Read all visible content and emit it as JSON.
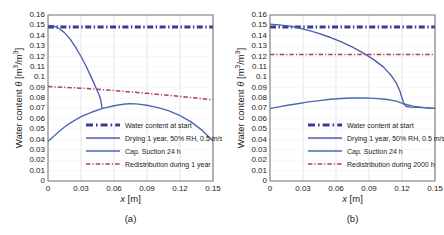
{
  "figure": {
    "width": 444,
    "height": 235,
    "background": "#ffffff"
  },
  "colors": {
    "start_line": "#3b3b8f",
    "drying_line": "#4a5fa5",
    "suction_line": "#4a6ab0",
    "redistribution_line": "#b23a6b",
    "axis": "#6f6f6f",
    "grid": "#d9d9e3",
    "text": "#1a1a1a"
  },
  "panels": [
    {
      "id": "a",
      "caption": "(a)",
      "xlabel_italic": "x",
      "xlabel_unit": "[m]",
      "ylabel_prefix": "Water content ",
      "ylabel_symbol": "θ",
      "ylabel_unit": "[m³/m³]",
      "xticks": [
        "0",
        "0.03",
        "0.06",
        "0.09",
        "0.12",
        "0.15"
      ],
      "xtick_values": [
        0,
        0.03,
        0.06,
        0.09,
        0.12,
        0.15
      ],
      "yticks": [
        "0",
        "0.01",
        "0.02",
        "0.03",
        "0.04",
        "0.05",
        "0.06",
        "0.07",
        "0.08",
        "0.09",
        "0.1",
        "0.11",
        "0.12",
        "0.13",
        "0.14",
        "0.15",
        "0.16"
      ],
      "ytick_values": [
        0,
        0.01,
        0.02,
        0.03,
        0.04,
        0.05,
        0.06,
        0.07,
        0.08,
        0.09,
        0.1,
        0.11,
        0.12,
        0.13,
        0.14,
        0.15,
        0.16
      ],
      "legend": [
        {
          "label": "Water content at start",
          "style": "dashdot-thick",
          "color": "#3b3b8f"
        },
        {
          "label": "Drying 1 year, 50% RH, 0.5 m/s",
          "style": "solid",
          "color": "#4a5fa5"
        },
        {
          "label": "Cap. Suction 24 h",
          "style": "solid",
          "color": "#4a6ab0"
        },
        {
          "label": "Redistribution during 1 year",
          "style": "dashdot-thin",
          "color": "#b23a6b"
        }
      ]
    },
    {
      "id": "b",
      "caption": "(b)",
      "xlabel_italic": "x",
      "xlabel_unit": "[m]",
      "ylabel_prefix": "Water content ",
      "ylabel_symbol": "θ",
      "ylabel_unit": "[m³/m³]",
      "xticks": [
        "0",
        "0.03",
        "0.06",
        "0.09",
        "0.12",
        "0.15"
      ],
      "xtick_values": [
        0,
        0.03,
        0.06,
        0.09,
        0.12,
        0.15
      ],
      "yticks": [
        "0",
        "0.01",
        "0.02",
        "0.03",
        "0.04",
        "0.05",
        "0.06",
        "0.07",
        "0.08",
        "0.09",
        "0.1",
        "0.11",
        "0.12",
        "0.13",
        "0.14",
        "0.15",
        "0.16"
      ],
      "ytick_values": [
        0,
        0.01,
        0.02,
        0.03,
        0.04,
        0.05,
        0.06,
        0.07,
        0.08,
        0.09,
        0.1,
        0.11,
        0.12,
        0.13,
        0.14,
        0.15,
        0.16
      ],
      "legend": [
        {
          "label": "Water content at start",
          "style": "dashdot-thick",
          "color": "#3b3b8f"
        },
        {
          "label": "Drying 1 year, 50% RH, 0.5 m/s",
          "style": "solid",
          "color": "#4a5fa5"
        },
        {
          "label": "Cap. Suction 24 h",
          "style": "solid",
          "color": "#4a6ab0"
        },
        {
          "label": "Redistribution during 2000 h",
          "style": "dashdot-thin",
          "color": "#b23a6b"
        }
      ]
    }
  ],
  "chart_data": [
    {
      "type": "line",
      "panel": "a",
      "title": "(a)",
      "xlabel": "x [m]",
      "ylabel": "Water content θ [m³/m³]",
      "xlim": [
        0,
        0.15
      ],
      "ylim": [
        0,
        0.16
      ],
      "xticks": [
        0,
        0.03,
        0.06,
        0.09,
        0.12,
        0.15
      ],
      "yticks": [
        0,
        0.01,
        0.02,
        0.03,
        0.04,
        0.05,
        0.06,
        0.07,
        0.08,
        0.09,
        0.1,
        0.11,
        0.12,
        0.13,
        0.14,
        0.15,
        0.16
      ],
      "grid": true,
      "legend_position": "lower center",
      "series": [
        {
          "name": "Water content at start",
          "style": "dashdot-thick",
          "color": "#3b3b8f",
          "x": [
            0,
            0.15
          ],
          "y": [
            0.1485,
            0.1485
          ]
        },
        {
          "name": "Drying 1 year, 50% RH, 0.5 m/s",
          "style": "solid",
          "color": "#4a5fa5",
          "x": [
            0,
            0.005,
            0.01,
            0.015,
            0.02,
            0.025,
            0.03,
            0.034,
            0.038,
            0.041,
            0.044,
            0.046,
            0.0475,
            0.0485,
            0.049,
            0.05
          ],
          "y": [
            0.15,
            0.1495,
            0.147,
            0.143,
            0.137,
            0.129,
            0.12,
            0.112,
            0.103,
            0.096,
            0.089,
            0.084,
            0.08,
            0.0745,
            0.071,
            0.07
          ]
        },
        {
          "name": "Cap. Suction 24 h",
          "style": "solid",
          "color": "#4a6ab0",
          "x": [
            0,
            0.005,
            0.01,
            0.015,
            0.02,
            0.03,
            0.04,
            0.05,
            0.06,
            0.07,
            0.075,
            0.08,
            0.09,
            0.1,
            0.11,
            0.12,
            0.13,
            0.14,
            0.15
          ],
          "y": [
            0.038,
            0.043,
            0.0478,
            0.052,
            0.0558,
            0.062,
            0.0665,
            0.07,
            0.0725,
            0.0742,
            0.0745,
            0.0743,
            0.073,
            0.0708,
            0.0675,
            0.063,
            0.057,
            0.049,
            0.0385
          ]
        },
        {
          "name": "Redistribution during 1 year",
          "style": "dashdot-thin",
          "color": "#b23a6b",
          "x": [
            0,
            0.03,
            0.06,
            0.09,
            0.12,
            0.15
          ],
          "y": [
            0.091,
            0.0895,
            0.0872,
            0.0845,
            0.0815,
            0.0782
          ]
        }
      ]
    },
    {
      "type": "line",
      "panel": "b",
      "title": "(b)",
      "xlabel": "x [m]",
      "ylabel": "Water content θ [m³/m³]",
      "xlim": [
        0,
        0.15
      ],
      "ylim": [
        0,
        0.16
      ],
      "xticks": [
        0,
        0.03,
        0.06,
        0.09,
        0.12,
        0.15
      ],
      "yticks": [
        0,
        0.01,
        0.02,
        0.03,
        0.04,
        0.05,
        0.06,
        0.07,
        0.08,
        0.09,
        0.1,
        0.11,
        0.12,
        0.13,
        0.14,
        0.15,
        0.16
      ],
      "grid": true,
      "legend_position": "lower center",
      "series": [
        {
          "name": "Water content at start",
          "style": "dashdot-thick",
          "color": "#3b3b8f",
          "x": [
            0,
            0.15
          ],
          "y": [
            0.1485,
            0.1485
          ]
        },
        {
          "name": "Drying 1 year, 50% RH, 0.5 m/s",
          "style": "solid",
          "color": "#4a5fa5",
          "x": [
            0,
            0.008,
            0.016,
            0.025,
            0.035,
            0.045,
            0.055,
            0.065,
            0.075,
            0.085,
            0.095,
            0.103,
            0.11,
            0.115,
            0.118,
            0.12,
            0.122,
            0.124,
            0.128,
            0.134,
            0.14,
            0.145,
            0.15
          ],
          "y": [
            0.1512,
            0.1505,
            0.1495,
            0.1478,
            0.1452,
            0.142,
            0.1383,
            0.134,
            0.129,
            0.1232,
            0.1165,
            0.11,
            0.102,
            0.094,
            0.087,
            0.08,
            0.074,
            0.0718,
            0.0712,
            0.071,
            0.0707,
            0.0703,
            0.07
          ]
        },
        {
          "name": "Cap. Suction 24 h",
          "style": "solid",
          "color": "#4a6ab0",
          "x": [
            0,
            0.008,
            0.016,
            0.025,
            0.035,
            0.045,
            0.055,
            0.065,
            0.075,
            0.085,
            0.095,
            0.105,
            0.115,
            0.122,
            0.13,
            0.14,
            0.15
          ],
          "y": [
            0.07,
            0.0715,
            0.073,
            0.0745,
            0.0762,
            0.0775,
            0.0788,
            0.0795,
            0.08,
            0.08,
            0.0797,
            0.0788,
            0.077,
            0.0742,
            0.0722,
            0.0708,
            0.07
          ]
        },
        {
          "name": "Redistribution during 2000 h",
          "style": "dashdot-thin",
          "color": "#b23a6b",
          "x": [
            0,
            0.15
          ],
          "y": [
            0.122,
            0.122
          ]
        }
      ]
    }
  ]
}
